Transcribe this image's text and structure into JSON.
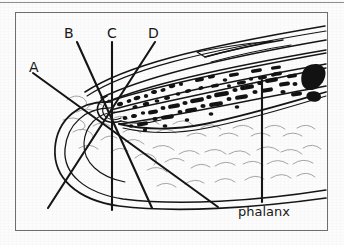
{
  "figure": {
    "kind": "anatomical-line-drawing",
    "frame": {
      "border_color": "#6e6e6e"
    },
    "background_color": "#fcfcfc",
    "ink_color": "#151515",
    "texture_color": "#9a9a9a"
  },
  "top_rule": {
    "color": "#8d8d8d"
  },
  "labels": {
    "a": "A",
    "b": "B",
    "c": "C",
    "d": "D",
    "phalanx": "phalanx"
  },
  "leader_lines": [
    {
      "id": "A",
      "label": "A",
      "from": [
        18,
        61
      ],
      "to": [
        203,
        195
      ]
    },
    {
      "id": "B",
      "label": "B",
      "from": [
        62,
        30
      ],
      "to": [
        137,
        196
      ]
    },
    {
      "id": "C",
      "label": "C",
      "from": [
        97,
        30
      ],
      "to": [
        97,
        198
      ]
    },
    {
      "id": "D",
      "label": "D",
      "from": [
        140,
        30
      ],
      "to": [
        33,
        196
      ]
    },
    {
      "id": "phalanx",
      "label": "phalanx",
      "from": [
        247,
        68
      ],
      "to": [
        247,
        190
      ]
    }
  ],
  "convergence_point": [
    92,
    84
  ],
  "label_positions": {
    "a": [
      14,
      50
    ],
    "b": [
      57,
      18
    ],
    "c": [
      92,
      18
    ],
    "d": [
      135,
      18
    ],
    "phalanx": [
      222,
      200
    ]
  },
  "colors": {
    "ink": "#151515",
    "frame": "#6e6e6e",
    "rule": "#8d8d8d",
    "tissue_texture": "#9a9a9a",
    "paper": "#fcfcfc"
  }
}
